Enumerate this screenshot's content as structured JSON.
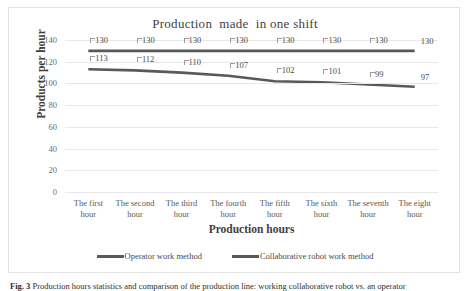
{
  "figure": {
    "caption_label": "Fig. 3",
    "caption_text": "Production hours statistics and comparison of the production line: working collaborative robot vs. an operator"
  },
  "chart_data": {
    "type": "line",
    "title": "Production  made  in one shift",
    "xlabel": "Production hours",
    "ylabel": "Products per hour",
    "categories": [
      "The first hour",
      "The second hour",
      "The third hour",
      "The fourth hour",
      "The fifth hour",
      "The sixth hour",
      "The seventh hour",
      "The eight hour"
    ],
    "series": [
      {
        "name": "Operator work method",
        "values": [
          130,
          130,
          130,
          130,
          130,
          130,
          130,
          130
        ],
        "color": "#595959"
      },
      {
        "name": "Collaborative robot work method",
        "values": [
          113,
          112,
          110,
          107,
          102,
          101,
          99,
          97
        ],
        "color": "#595959"
      }
    ],
    "ylim": [
      0,
      140
    ],
    "yticks": [
      140,
      120,
      100,
      80,
      60,
      40,
      20,
      0
    ],
    "ytick_labels": [
      "140",
      "120",
      "100",
      "80",
      "60",
      "40",
      "20",
      "0"
    ],
    "grid": true,
    "legend_position": "bottom",
    "data_labels_visible": true
  }
}
